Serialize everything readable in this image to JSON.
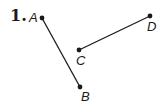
{
  "problem": {
    "number": "1."
  },
  "diagram": {
    "type": "line-segments",
    "points": [
      {
        "label": "A",
        "x": 42,
        "y": 18,
        "label_x": 29,
        "label_y": 22
      },
      {
        "label": "B",
        "x": 80,
        "y": 87,
        "label_x": 81,
        "label_y": 101
      },
      {
        "label": "C",
        "x": 79,
        "y": 50,
        "label_x": 76,
        "label_y": 65
      },
      {
        "label": "D",
        "x": 150,
        "y": 16,
        "label_x": 147,
        "label_y": 31
      }
    ],
    "segments": [
      {
        "from": "A",
        "to": "B"
      },
      {
        "from": "C",
        "to": "D"
      }
    ],
    "line_color": "#1a1a1a"
  }
}
